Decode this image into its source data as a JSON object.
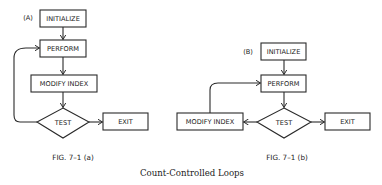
{
  "diagram_a": {
    "tag": "(A)",
    "nodes": {
      "initialize": "INITIALIZE",
      "perform": "PERFORM",
      "modify_index": "MODIFY INDEX",
      "test": "TEST",
      "exit": "EXIT"
    },
    "figure_label": "FIG. 7–1 (a)"
  },
  "diagram_b": {
    "tag": "(B)",
    "nodes": {
      "initialize": "INITIALIZE",
      "perform": "PERFORM",
      "modify_index": "MODIFY INDEX",
      "test": "TEST",
      "exit": "EXIT"
    },
    "figure_label": "FIG. 7–1 (b)"
  },
  "caption": "Count-Controlled Loops"
}
